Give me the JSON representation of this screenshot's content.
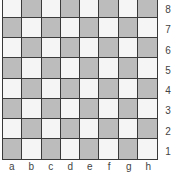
{
  "board": {
    "files": [
      "a",
      "b",
      "c",
      "d",
      "e",
      "f",
      "g",
      "h"
    ],
    "ranks": [
      "8",
      "7",
      "6",
      "5",
      "4",
      "3",
      "2",
      "1"
    ],
    "colors": {
      "light": "#f5f5f5",
      "dark": "#bcbcbc",
      "line": "#3a3a3a"
    },
    "pieces": []
  }
}
